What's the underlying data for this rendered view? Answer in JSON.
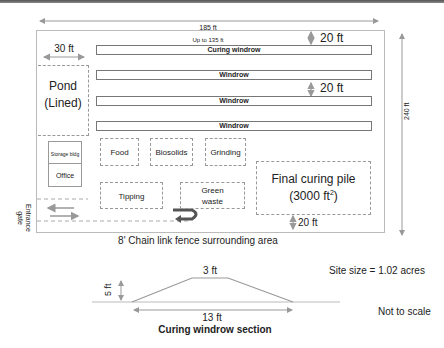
{
  "dimensions": {
    "width_label": "185 ft",
    "height_label": "240 ft",
    "pond_width_label": "30 ft",
    "windrow_length_label": "Up to 135 ft",
    "spacing_top_label": "20 ft",
    "spacing_mid_label": "20 ft",
    "spacing_bottom_label": "20 ft"
  },
  "windrows": [
    {
      "label": "Curing windrow"
    },
    {
      "label": "Windrow"
    },
    {
      "label": "Windrow"
    },
    {
      "label": "Windrow"
    }
  ],
  "areas": {
    "pond": {
      "line1": "Pond",
      "line2": "(Lined)"
    },
    "storage": "Storage bldg",
    "office": "Office",
    "food": "Food",
    "biosolids": "Biosolids",
    "grinding": "Grinding",
    "tipping": "Tipping",
    "green_waste": {
      "line1": "Green",
      "line2": "waste"
    },
    "final_curing": {
      "line1": "Final curing pile",
      "line2_prefix": "(3000 ft",
      "line2_sup": "2",
      "line2_suffix": ")"
    },
    "entrance": {
      "line1": "Entrance",
      "line2": "gate"
    }
  },
  "fence_caption": "8' Chain link fence surrounding area",
  "section": {
    "top_width": "3 ft",
    "height": "5 ft",
    "base_width": "13 ft",
    "title": "Curing windrow section"
  },
  "site_size": "Site size = 1.02 acres",
  "scale_note": "Not to scale",
  "colors": {
    "line": "#999999",
    "bar_border": "#777777",
    "text": "#222222",
    "uturn": "#555555"
  }
}
